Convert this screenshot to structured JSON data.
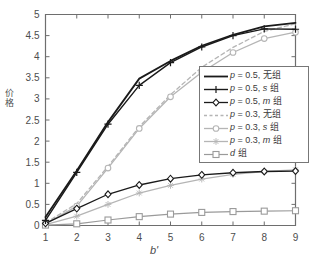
{
  "chart_data": {
    "type": "line",
    "title": "",
    "xlabel": "b'",
    "ylabel": "价格",
    "xlim": [
      1,
      9
    ],
    "ylim": [
      0,
      5
    ],
    "xticks": [
      "1",
      "2",
      "3",
      "4",
      "5",
      "6",
      "7",
      "8",
      "9"
    ],
    "yticks": [
      "0",
      "0.5",
      "1",
      "1.5",
      "2",
      "2.5",
      "3",
      "3.5",
      "4",
      "4.5",
      "5"
    ],
    "grid": false,
    "legend_position": "center-right",
    "x": [
      1,
      2,
      3,
      4,
      5,
      6,
      7,
      8,
      9
    ],
    "series": [
      {
        "name": "p = 0.5, 无组",
        "label_prefix": "p",
        "label_value": "= 0.5,",
        "label_suffix": "无组",
        "color": "#1a1a1a",
        "marker": "none",
        "dash": "solid",
        "width": 1.8,
        "values": [
          0.2,
          1.3,
          2.45,
          3.48,
          3.9,
          4.26,
          4.52,
          4.72,
          4.8
        ]
      },
      {
        "name": "p = 0.5, s 组",
        "label_prefix": "p",
        "label_value": "= 0.5,",
        "label_suffix": "s 组",
        "color": "#1a1a1a",
        "marker": "plus",
        "dash": "solid",
        "width": 1.4,
        "values": [
          0.12,
          1.26,
          2.4,
          3.32,
          3.86,
          4.23,
          4.5,
          4.66,
          4.65
        ]
      },
      {
        "name": "p = 0.5, m 组",
        "label_prefix": "p",
        "label_value": "= 0.5,",
        "label_suffix": "m 组",
        "color": "#1a1a1a",
        "marker": "diamond",
        "dash": "solid",
        "width": 1.3,
        "values": [
          0.05,
          0.4,
          0.74,
          0.96,
          1.11,
          1.2,
          1.25,
          1.28,
          1.29
        ]
      },
      {
        "name": "p = 0.3, 无组",
        "label_prefix": "p",
        "label_value": "= 0.3,",
        "label_suffix": "无组",
        "color": "#b5b5b5",
        "marker": "none",
        "dash": "dashed",
        "width": 1.3,
        "values": [
          0.06,
          0.52,
          1.4,
          2.34,
          3.1,
          3.75,
          4.22,
          4.6,
          4.78
        ]
      },
      {
        "name": "p = 0.3, s 组",
        "label_prefix": "p",
        "label_value": "= 0.3,",
        "label_suffix": "s 组",
        "color": "#b5b5b5",
        "marker": "circle",
        "dash": "solid",
        "width": 1.3,
        "values": [
          0.04,
          0.46,
          1.36,
          2.3,
          3.05,
          3.63,
          4.1,
          4.43,
          4.58
        ]
      },
      {
        "name": "p = 0.3, m 组",
        "label_prefix": "p",
        "label_value": "= 0.3,",
        "label_suffix": "m 组",
        "color": "#b5b5b5",
        "marker": "star",
        "dash": "solid",
        "width": 1.3,
        "values": [
          0.02,
          0.22,
          0.5,
          0.77,
          0.95,
          1.1,
          1.21,
          1.28,
          1.32
        ]
      },
      {
        "name": "d 组",
        "label_prefix": "d",
        "label_value": "",
        "label_suffix": "组",
        "color": "#9a9a9a",
        "marker": "square",
        "dash": "solid",
        "width": 1.2,
        "values": [
          0.01,
          0.04,
          0.13,
          0.21,
          0.27,
          0.31,
          0.33,
          0.34,
          0.35
        ]
      }
    ]
  },
  "axes": {
    "ylabel_chars": [
      "价",
      "格"
    ],
    "xlabel_text": "b'"
  }
}
